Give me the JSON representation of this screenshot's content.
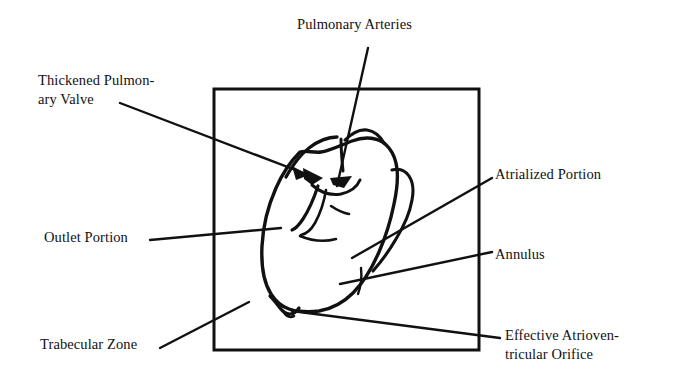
{
  "figure": {
    "background_color": "#ffffff",
    "ink_color": "#111111",
    "frame": {
      "name": "image-border-box",
      "x": 214,
      "y": 89,
      "width": 265,
      "height": 261,
      "stroke_width": 3
    }
  },
  "labels": {
    "pulmonary_arteries": "Pulmonary Arteries",
    "thickened_pulmonary_valve": "Thickened Pulmon-\nary Valve",
    "outlet_portion": "Outlet Portion",
    "trabecular_zone": "Trabecular Zone",
    "atrialized_portion": "Atrialized Portion",
    "annulus": "Annulus",
    "effective_atrioventricular_orifice": "Effective Atrioven-\ntricular Orifice"
  },
  "leader_lines": [
    {
      "name": "leader-pulmonary-arteries",
      "from": [
        368,
        48
      ],
      "to": [
        337,
        186
      ],
      "arrowhead": false
    },
    {
      "name": "leader-thickened-valve",
      "from": [
        120,
        103
      ],
      "to": [
        308,
        175
      ],
      "arrowhead": true
    },
    {
      "name": "leader-outlet-portion",
      "from": [
        150,
        240
      ],
      "to": [
        281,
        228
      ],
      "arrowhead": false
    },
    {
      "name": "leader-trabecular-zone",
      "from": [
        160,
        348
      ],
      "to": [
        249,
        302
      ],
      "arrowhead": false
    },
    {
      "name": "leader-atrialized-portion",
      "from": [
        492,
        178
      ],
      "to": [
        352,
        258
      ],
      "arrowhead": false
    },
    {
      "name": "leader-annulus",
      "from": [
        492,
        252
      ],
      "to": [
        340,
        284
      ],
      "arrowhead": false
    },
    {
      "name": "leader-effective-orifice",
      "from": [
        500,
        338
      ],
      "to": [
        292,
        311
      ],
      "arrowhead": false
    }
  ]
}
